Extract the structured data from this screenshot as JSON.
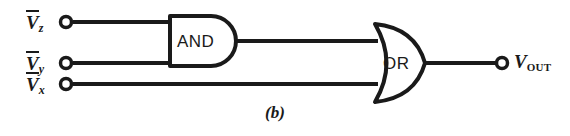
{
  "figure": {
    "caption": "(b)",
    "background_color": "#ffffff",
    "ink_color": "#1a1a1a"
  },
  "inputs": [
    {
      "name": "input-vz",
      "base": "V",
      "subscript": "z",
      "overbar": true,
      "terminal": "open-circle"
    },
    {
      "name": "input-vy",
      "base": "V",
      "subscript": "y",
      "overbar": true,
      "terminal": "open-circle"
    },
    {
      "name": "input-vx",
      "base": "V",
      "subscript": "x",
      "overbar": true,
      "terminal": "open-circle"
    }
  ],
  "gates": [
    {
      "name": "and-gate",
      "label": "AND",
      "type": "AND",
      "inputs": [
        "input-vz",
        "input-vy"
      ]
    },
    {
      "name": "or-gate",
      "label": "OR",
      "type": "OR",
      "inputs": [
        "and-gate",
        "input-vx"
      ]
    }
  ],
  "output": {
    "name": "output-vout",
    "base": "V",
    "subscript": "OUT",
    "terminal": "open-circle"
  }
}
